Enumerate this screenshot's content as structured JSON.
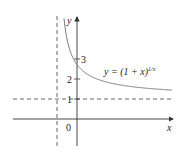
{
  "chart_data": {
    "type": "line",
    "title": "",
    "xlabel": "x",
    "ylabel": "y",
    "function": "y = (1 + x)^(1/x)",
    "annotation": "y = (1 + x)^{1/x}",
    "series": [
      {
        "name": "y = (1 + x)^(1/x)",
        "x": [
          -0.65,
          -0.5,
          -0.25,
          0.0,
          0.5,
          1.0,
          2.0,
          3.0,
          4.0,
          4.75
        ],
        "y": [
          5.03,
          4.0,
          3.16,
          2.718,
          2.25,
          2.0,
          1.73,
          1.59,
          1.5,
          1.44
        ]
      }
    ],
    "asymptotes": [
      {
        "type": "vertical",
        "x": -1,
        "style": "dashed"
      },
      {
        "type": "horizontal",
        "y": 1,
        "style": "dashed"
      }
    ],
    "y_ticks": [
      1,
      2,
      3
    ],
    "x_ticks": [
      0
    ],
    "xlim": [
      -3.2,
      4.8
    ],
    "ylim": [
      -1.4,
      5.1
    ],
    "grid": false,
    "legend": null
  },
  "labels": {
    "x_axis": "x",
    "y_axis": "y",
    "origin": "0",
    "tick_1": "1",
    "tick_2": "2",
    "tick_3": "3",
    "equation_prefix": "y = (1 + x)",
    "equation_exponent": "1/x"
  }
}
